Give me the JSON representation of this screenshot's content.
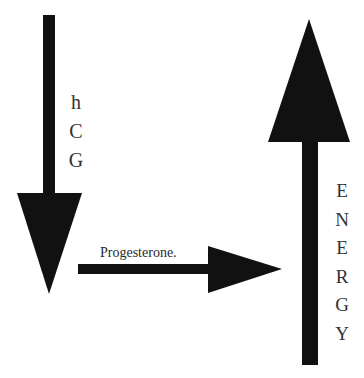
{
  "diagram": {
    "arrows": [
      {
        "id": "hcg-arrow",
        "direction": "down",
        "label_letters": [
          "h",
          "C",
          "G"
        ]
      },
      {
        "id": "progesterone-arrow",
        "direction": "right",
        "label": "Progesterone."
      },
      {
        "id": "energy-arrow",
        "direction": "up",
        "label_letters": [
          "E",
          "N",
          "E",
          "R",
          "G",
          "Y"
        ]
      }
    ],
    "colors": {
      "arrow_fill": "#111111",
      "text": "#2a2a2a",
      "background": "#ffffff"
    }
  }
}
